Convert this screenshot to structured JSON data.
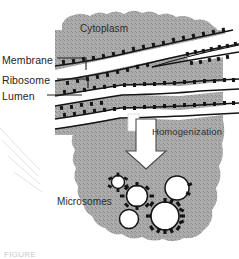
{
  "figure": {
    "caption": "FIGURE"
  },
  "labels": {
    "membrane": "Membrane",
    "ribosome": "Ribosome",
    "lumen": "Lumen",
    "cytoplasm": "Cytoplasm",
    "homogenization": "Homogenization",
    "microsomes": "Microsomes"
  },
  "colors": {
    "cytoplasm_fill": "#a9a9a9",
    "cytoplasm_speckle": "#8d8d8d",
    "membrane_stroke": "#1a1a1a",
    "lumen_fill": "#ffffff",
    "arrow_fill": "#ffffff",
    "arrow_stroke": "#3a3a3a",
    "label_text": "#252525",
    "background": "#ffffff"
  },
  "vesicles": [
    {
      "name": "microsome-small-top-left",
      "cx": 118,
      "cy": 182,
      "r": 6.5,
      "ribosomes": 6
    },
    {
      "name": "microsome-mid-left",
      "cx": 137,
      "cy": 196,
      "r": 10.5,
      "ribosomes": 8
    },
    {
      "name": "microsome-right-smooth",
      "cx": 177,
      "cy": 188,
      "r": 12,
      "ribosomes": 2
    },
    {
      "name": "microsome-bottom-left-smooth",
      "cx": 129,
      "cy": 219,
      "r": 9.5,
      "ribosomes": 0
    },
    {
      "name": "microsome-bottom-right",
      "cx": 165,
      "cy": 216,
      "r": 14,
      "ribosomes": 13
    }
  ],
  "er_layers": [
    {
      "name": "er-cisterna-1"
    },
    {
      "name": "er-cisterna-2"
    },
    {
      "name": "er-cisterna-3"
    },
    {
      "name": "er-cisterna-4"
    }
  ]
}
